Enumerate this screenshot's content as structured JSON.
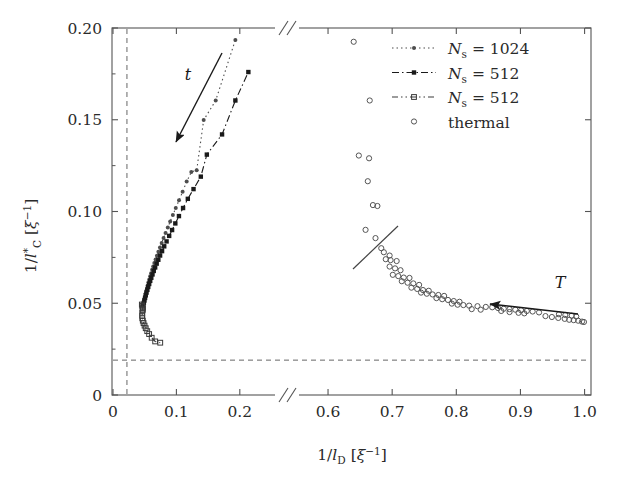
{
  "chart_data": {
    "type": "scatter",
    "title": "",
    "xlabel": "1/l_D [ξ^-1]",
    "ylabel": "1/l*_C [ξ^-1]",
    "axis_break": true,
    "x_segments": [
      {
        "range": [
          0.0,
          0.235
        ],
        "ticks": [
          0,
          0.1,
          0.2
        ],
        "ticklabels": [
          "0",
          "0.1",
          "0.2"
        ]
      },
      {
        "range": [
          0.575,
          1.01
        ],
        "ticks": [
          0.6,
          0.7,
          0.8,
          0.9,
          1.0
        ],
        "ticklabels": [
          "0.6",
          "0.7",
          "0.8",
          "0.9",
          "1.0"
        ]
      }
    ],
    "ylim": [
      0,
      0.2
    ],
    "yticks": [
      0,
      0.05,
      0.1,
      0.15,
      0.2
    ],
    "yticklabels": [
      "0",
      "0.05",
      "0.10",
      "0.15",
      "0.20"
    ],
    "grid": false,
    "legend_position": "top-right",
    "reference_lines": [
      {
        "name": "vertical-dashed",
        "orientation": "vertical",
        "value": 0.022,
        "style": "dashed"
      },
      {
        "name": "horizontal-dashed",
        "orientation": "horizontal",
        "value": 0.019,
        "style": "dashed"
      }
    ],
    "annotations": [
      {
        "label": "t",
        "x": 0.165,
        "y": 0.165,
        "arrow_from": [
          0.166,
          0.1905
        ],
        "arrow_to": [
          0.0915,
          0.1365
        ]
      },
      {
        "label": "T",
        "x": 0.947,
        "y": 0.0845,
        "arrow_from": [
          0.973,
          0.0735
        ],
        "arrow_to": [
          0.8245,
          0.0885
        ]
      },
      {
        "label": "guide-line",
        "from": [
          0.6085,
          0.0525
        ],
        "to": [
          0.6835,
          0.0755
        ]
      }
    ],
    "series": [
      {
        "name": "N_s = 1024",
        "marker": "filled-circle",
        "line": "dotted",
        "color": "#4d4d4d",
        "points": [
          [
            0.0465,
            0.0487
          ],
          [
            0.0472,
            0.0495
          ],
          [
            0.048,
            0.0505
          ],
          [
            0.0489,
            0.0516
          ],
          [
            0.0497,
            0.0527
          ],
          [
            0.0506,
            0.054
          ],
          [
            0.0515,
            0.0554
          ],
          [
            0.0525,
            0.0568
          ],
          [
            0.0536,
            0.0583
          ],
          [
            0.0547,
            0.0598
          ],
          [
            0.0559,
            0.0614
          ],
          [
            0.0572,
            0.063
          ],
          [
            0.0586,
            0.0647
          ],
          [
            0.0601,
            0.0664
          ],
          [
            0.0617,
            0.0682
          ],
          [
            0.0634,
            0.07
          ],
          [
            0.0652,
            0.0719
          ],
          [
            0.0672,
            0.0739
          ],
          [
            0.0693,
            0.0759
          ],
          [
            0.0716,
            0.0781
          ],
          [
            0.0741,
            0.0804
          ],
          [
            0.0768,
            0.0829
          ],
          [
            0.0797,
            0.0855
          ],
          [
            0.0829,
            0.0883
          ],
          [
            0.0864,
            0.0913
          ],
          [
            0.0902,
            0.0946
          ],
          [
            0.0944,
            0.0981
          ],
          [
            0.099,
            0.1019
          ],
          [
            0.1041,
            0.1061
          ],
          [
            0.1098,
            0.1107
          ],
          [
            0.1162,
            0.1163
          ],
          [
            0.1235,
            0.1215
          ],
          [
            0.132,
            0.1225
          ],
          [
            0.143,
            0.1498
          ],
          [
            0.162,
            0.1605
          ],
          [
            0.193,
            0.1935
          ]
        ]
      },
      {
        "name": "N_s = 512",
        "marker": "filled-square",
        "line": "dash-dot",
        "color": "#1a1a1a",
        "points": [
          [
            0.0478,
            0.049
          ],
          [
            0.0487,
            0.0502
          ],
          [
            0.0496,
            0.0515
          ],
          [
            0.0506,
            0.0529
          ],
          [
            0.0517,
            0.0543
          ],
          [
            0.0529,
            0.0558
          ],
          [
            0.0542,
            0.0573
          ],
          [
            0.0556,
            0.0589
          ],
          [
            0.0571,
            0.0605
          ],
          [
            0.0587,
            0.0622
          ],
          [
            0.0604,
            0.0639
          ],
          [
            0.0623,
            0.0657
          ],
          [
            0.0643,
            0.0676
          ],
          [
            0.0665,
            0.0695
          ],
          [
            0.0689,
            0.0716
          ],
          [
            0.0715,
            0.0737
          ],
          [
            0.0743,
            0.076
          ],
          [
            0.0774,
            0.0784
          ],
          [
            0.0808,
            0.081
          ],
          [
            0.0845,
            0.0837
          ],
          [
            0.0886,
            0.0867
          ],
          [
            0.0932,
            0.0899
          ],
          [
            0.0983,
            0.0935
          ],
          [
            0.104,
            0.0975
          ],
          [
            0.1105,
            0.1019
          ],
          [
            0.118,
            0.1069
          ],
          [
            0.127,
            0.1122
          ],
          [
            0.1385,
            0.119
          ],
          [
            0.148,
            0.131
          ],
          [
            0.172,
            0.142
          ],
          [
            0.193,
            0.1605
          ],
          [
            0.2135,
            0.176
          ]
        ]
      },
      {
        "name": "N_s = 512",
        "marker": "open-square",
        "line": "dash-dot-dot",
        "color": "#3a3a3a",
        "points": [
          [
            0.0455,
            0.0493
          ],
          [
            0.0462,
            0.0486
          ],
          [
            0.0468,
            0.0478
          ],
          [
            0.047,
            0.047
          ],
          [
            0.0468,
            0.0462
          ],
          [
            0.0462,
            0.0448
          ],
          [
            0.046,
            0.0432
          ],
          [
            0.0462,
            0.0418
          ],
          [
            0.047,
            0.0405
          ],
          [
            0.0482,
            0.0392
          ],
          [
            0.0498,
            0.0378
          ],
          [
            0.0516,
            0.0364
          ],
          [
            0.054,
            0.0348
          ],
          [
            0.057,
            0.0332
          ],
          [
            0.061,
            0.0312
          ],
          [
            0.0665,
            0.0292
          ],
          [
            0.0745,
            0.0285
          ]
        ]
      },
      {
        "name": "thermal",
        "marker": "open-circle",
        "line": "none",
        "color": "#555555",
        "points": [
          [
            0.64,
            0.1925
          ],
          [
            0.665,
            0.1605
          ],
          [
            0.648,
            0.1305
          ],
          [
            0.664,
            0.129
          ],
          [
            0.662,
            0.1165
          ],
          [
            0.67,
            0.1035
          ],
          [
            0.677,
            0.103
          ],
          [
            0.6585,
            0.09
          ],
          [
            0.674,
            0.0855
          ],
          [
            0.683,
            0.08
          ],
          [
            0.687,
            0.0778
          ],
          [
            0.696,
            0.076
          ],
          [
            0.69,
            0.074
          ],
          [
            0.6975,
            0.0735
          ],
          [
            0.707,
            0.073
          ],
          [
            0.696,
            0.07
          ],
          [
            0.7045,
            0.069
          ],
          [
            0.713,
            0.068
          ],
          [
            0.701,
            0.0655
          ],
          [
            0.7095,
            0.0648
          ],
          [
            0.718,
            0.064
          ],
          [
            0.727,
            0.0638
          ],
          [
            0.715,
            0.062
          ],
          [
            0.724,
            0.0612
          ],
          [
            0.733,
            0.0608
          ],
          [
            0.742,
            0.06
          ],
          [
            0.73,
            0.0585
          ],
          [
            0.739,
            0.0578
          ],
          [
            0.748,
            0.0572
          ],
          [
            0.757,
            0.0568
          ],
          [
            0.745,
            0.0558
          ],
          [
            0.754,
            0.0552
          ],
          [
            0.763,
            0.0548
          ],
          [
            0.772,
            0.0545
          ],
          [
            0.781,
            0.054
          ],
          [
            0.769,
            0.0528
          ],
          [
            0.778,
            0.0522
          ],
          [
            0.787,
            0.0518
          ],
          [
            0.796,
            0.0512
          ],
          [
            0.805,
            0.0508
          ],
          [
            0.793,
            0.0498
          ],
          [
            0.802,
            0.0492
          ],
          [
            0.811,
            0.049
          ],
          [
            0.82,
            0.0487
          ],
          [
            0.833,
            0.0484
          ],
          [
            0.846,
            0.048
          ],
          [
            0.856,
            0.0478
          ],
          [
            0.865,
            0.0474
          ],
          [
            0.874,
            0.047
          ],
          [
            0.883,
            0.0468
          ],
          [
            0.892,
            0.0465
          ],
          [
            0.901,
            0.0462
          ],
          [
            0.91,
            0.0458
          ],
          [
            0.919,
            0.0455
          ],
          [
            0.929,
            0.045
          ],
          [
            0.939,
            0.043
          ],
          [
            0.949,
            0.0425
          ],
          [
            0.959,
            0.042
          ],
          [
            0.969,
            0.0415
          ],
          [
            0.976,
            0.041
          ],
          [
            0.983,
            0.0408
          ],
          [
            0.99,
            0.0405
          ],
          [
            0.996,
            0.04
          ],
          [
            0.999,
            0.0398
          ],
          [
            0.96,
            0.044
          ],
          [
            0.97,
            0.0436
          ],
          [
            0.98,
            0.0432
          ],
          [
            0.987,
            0.0428
          ],
          [
            0.897,
            0.0448
          ],
          [
            0.906,
            0.0445
          ],
          [
            0.883,
            0.0452
          ],
          [
            0.87,
            0.0458
          ],
          [
            0.824,
            0.0468
          ],
          [
            0.838,
            0.0465
          ]
        ]
      }
    ]
  },
  "legend": {
    "entries": [
      {
        "label_prefix": "N",
        "label_sub": "s",
        "label_rest": " = 1024",
        "marker": "filled-circle",
        "line": "dotted"
      },
      {
        "label_prefix": "N",
        "label_sub": "s",
        "label_rest": " = 512",
        "marker": "filled-square",
        "line": "dash-dot"
      },
      {
        "label_prefix": "N",
        "label_sub": "s",
        "label_rest": " = 512",
        "marker": "open-square",
        "line": "dash-dot-dot"
      },
      {
        "label_prefix": "thermal",
        "label_sub": "",
        "label_rest": "",
        "marker": "open-circle",
        "line": "none"
      }
    ]
  },
  "axes": {
    "y_label_parts": {
      "lead": "1/",
      "l": "l",
      "star": "*",
      "sub": "C",
      "bracket_open": " [",
      "xi": "ξ",
      "sup": "−1",
      "bracket_close": "]"
    },
    "x_label_parts": {
      "lead": "1/",
      "l": "l",
      "sub": "D",
      "bracket_open": " [",
      "xi": "ξ",
      "sup": "−1",
      "bracket_close": "]"
    },
    "x_ticklabels": [
      "0",
      "0.1",
      "0.2",
      "0.6",
      "0.7",
      "0.8",
      "0.9",
      "1.0"
    ],
    "y_ticklabels": [
      "0",
      "0.05",
      "0.10",
      "0.15",
      "0.20"
    ]
  },
  "annotations": {
    "t_label": "t",
    "T_label": "T"
  },
  "colors": {
    "frame": "#555555",
    "text": "#2a2a2a",
    "dashed": "#666666"
  }
}
